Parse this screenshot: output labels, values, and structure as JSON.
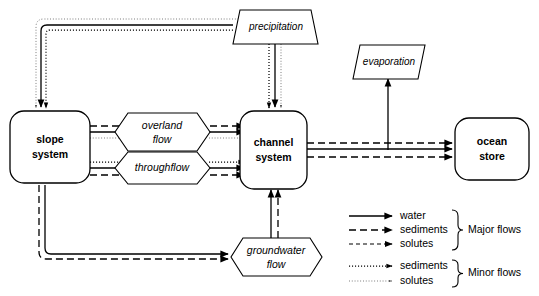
{
  "diagram": {
    "stores": [
      {
        "id": "slope",
        "label_line1": "slope",
        "label_line2": "system"
      },
      {
        "id": "channel",
        "label_line1": "channel",
        "label_line2": "system"
      },
      {
        "id": "ocean",
        "label_line1": "ocean",
        "label_line2": "store"
      }
    ],
    "processes": [
      {
        "id": "overland",
        "label_line1": "overland",
        "label_line2": "flow"
      },
      {
        "id": "throughflow",
        "label_line1": "throughflow",
        "label_line2": ""
      },
      {
        "id": "groundwater",
        "label_line1": "groundwater",
        "label_line2": "flow"
      }
    ],
    "io_nodes": [
      {
        "id": "precipitation",
        "label": "precipitation"
      },
      {
        "id": "evaporation",
        "label": "evaporation"
      }
    ]
  },
  "legend": {
    "major": {
      "group_label": "Major  flows",
      "entries": [
        {
          "id": "water",
          "label": "water",
          "style": "solid"
        },
        {
          "id": "sediments",
          "label": "sediments",
          "style": "long-dash"
        },
        {
          "id": "solutes",
          "label": "solutes",
          "style": "short-dash"
        }
      ]
    },
    "minor": {
      "group_label": "Minor  flows",
      "entries": [
        {
          "id": "sediments",
          "label": "sediments",
          "style": "bold-dotted"
        },
        {
          "id": "solutes",
          "label": "solutes",
          "style": "fine-dotted"
        }
      ]
    }
  },
  "colors": {
    "stroke": "#000000",
    "background": "#ffffff",
    "minor_solutes": "#555555"
  }
}
